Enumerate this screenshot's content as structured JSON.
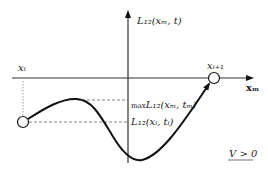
{
  "diagram": {
    "y_axis_label": "L₁₂(xₘ, t)",
    "x_axis_label": "xₘ",
    "left_point_label": "xᵢ",
    "right_point_label": "xᵢ₊₁",
    "max_label_prefix": "max",
    "max_label": "L₁₂(xₘ, tₘ)",
    "start_label": "L₁₂(xᵢ, tᵢ)",
    "condition_label": "V > 0",
    "colors": {
      "line": "#111111",
      "dash": "#666666"
    }
  }
}
